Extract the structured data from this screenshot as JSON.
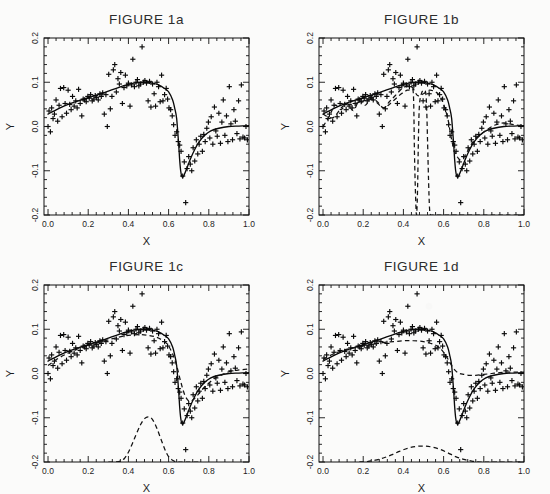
{
  "figure": {
    "background_color": "#fbfbfa",
    "ink_color": "#0a0a0a",
    "panel_count": 4
  },
  "panels": [
    {
      "id": "1a",
      "title": "FIGURE 1a",
      "xlabel": "X",
      "ylabel": "Y"
    },
    {
      "id": "1b",
      "title": "FIGURE 1b",
      "xlabel": "X",
      "ylabel": "Y"
    },
    {
      "id": "1c",
      "title": "FIGURE 1c",
      "xlabel": "X",
      "ylabel": "Y"
    },
    {
      "id": "1d",
      "title": "FIGURE 1d",
      "xlabel": "X",
      "ylabel": "Y"
    }
  ],
  "chart_data": [
    {
      "type": "scatter",
      "panel": "1a",
      "title": "FIGURE 1a",
      "xlabel": "X",
      "ylabel": "Y",
      "xlim": [
        -0.02,
        1.0
      ],
      "ylim": [
        -0.2,
        0.2
      ],
      "xticks": [
        0.0,
        0.2,
        0.4,
        0.6,
        0.8,
        1.0
      ],
      "yticks": [
        -0.2,
        -0.1,
        0.0,
        0.1,
        0.2
      ],
      "xtick_labels": [
        "0.0",
        "0.2",
        "0.4",
        "0.6",
        "0.8",
        "1.0"
      ],
      "ytick_labels": [
        "-0.2",
        "-0.1",
        "0.0",
        "0.1",
        "0.2"
      ],
      "minor_ticks_per_interval": 4,
      "grid": false,
      "legend": false,
      "marker": "plus",
      "series": [
        {
          "name": "data",
          "type": "scatter",
          "marker": "plus",
          "x": [
            0.0,
            0.005,
            0.012,
            0.018,
            0.025,
            0.032,
            0.04,
            0.048,
            0.055,
            0.062,
            0.07,
            0.078,
            0.085,
            0.092,
            0.1,
            0.108,
            0.115,
            0.122,
            0.13,
            0.138,
            0.145,
            0.152,
            0.16,
            0.168,
            0.175,
            0.182,
            0.19,
            0.198,
            0.205,
            0.212,
            0.22,
            0.228,
            0.235,
            0.242,
            0.25,
            0.258,
            0.265,
            0.272,
            0.28,
            0.288,
            0.295,
            0.302,
            0.31,
            0.318,
            0.325,
            0.332,
            0.34,
            0.348,
            0.355,
            0.362,
            0.37,
            0.378,
            0.385,
            0.392,
            0.4,
            0.408,
            0.415,
            0.422,
            0.43,
            0.438,
            0.445,
            0.452,
            0.46,
            0.468,
            0.475,
            0.482,
            0.49,
            0.498,
            0.505,
            0.512,
            0.52,
            0.528,
            0.535,
            0.542,
            0.55,
            0.558,
            0.565,
            0.572,
            0.58,
            0.588,
            0.595,
            0.602,
            0.61,
            0.618,
            0.625,
            0.632,
            0.64,
            0.648,
            0.655,
            0.662,
            0.67,
            0.678,
            0.685,
            0.692,
            0.7,
            0.708,
            0.715,
            0.722,
            0.73,
            0.738,
            0.745,
            0.752,
            0.76,
            0.768,
            0.775,
            0.782,
            0.79,
            0.798,
            0.805,
            0.812,
            0.82,
            0.828,
            0.835,
            0.842,
            0.85,
            0.858,
            0.865,
            0.872,
            0.88,
            0.888,
            0.895,
            0.902,
            0.91,
            0.918,
            0.925,
            0.932,
            0.94,
            0.948,
            0.955,
            0.962,
            0.97,
            0.978,
            0.985,
            0.992
          ],
          "y": [
            0.0,
            0.035,
            -0.012,
            0.042,
            0.018,
            0.028,
            0.06,
            0.012,
            0.048,
            0.086,
            0.022,
            0.088,
            0.052,
            0.03,
            0.082,
            0.05,
            0.038,
            0.068,
            0.046,
            0.058,
            0.042,
            0.084,
            0.052,
            0.024,
            0.062,
            0.06,
            0.056,
            0.068,
            0.064,
            0.072,
            0.058,
            0.062,
            0.07,
            0.066,
            0.06,
            0.074,
            0.068,
            0.076,
            0.028,
            0.072,
            0.0,
            0.118,
            0.04,
            0.068,
            0.128,
            0.14,
            0.078,
            0.108,
            0.096,
            0.122,
            0.052,
            0.088,
            0.116,
            0.092,
            0.098,
            0.046,
            0.094,
            0.152,
            0.09,
            0.1,
            0.106,
            0.092,
            0.096,
            0.18,
            0.1,
            0.104,
            0.098,
            0.058,
            0.102,
            0.044,
            0.096,
            0.074,
            0.046,
            0.1,
            0.09,
            0.056,
            0.116,
            0.058,
            0.072,
            0.086,
            0.062,
            0.042,
            0.038,
            0.024,
            0.004,
            -0.02,
            -0.012,
            -0.034,
            -0.042,
            -0.056,
            -0.112,
            -0.08,
            -0.172,
            -0.095,
            -0.068,
            -0.085,
            -0.1,
            -0.048,
            -0.078,
            -0.03,
            -0.062,
            -0.04,
            -0.022,
            -0.056,
            -0.018,
            -0.034,
            -0.004,
            0.01,
            -0.026,
            0.022,
            -0.04,
            0.044,
            -0.01,
            -0.022,
            0.03,
            -0.038,
            0.01,
            0.06,
            -0.02,
            0.024,
            -0.034,
            0.09,
            0.006,
            -0.03,
            0.038,
            0.012,
            -0.016,
            0.058,
            -0.028,
            0.094,
            -0.024,
            -0.026,
            0.0,
            -0.03
          ]
        },
        {
          "name": "fit-solid",
          "type": "line",
          "style": "solid",
          "x": [
            0.0,
            0.05,
            0.1,
            0.15,
            0.2,
            0.25,
            0.3,
            0.35,
            0.4,
            0.43,
            0.46,
            0.49,
            0.52,
            0.55,
            0.58,
            0.6,
            0.62,
            0.63,
            0.64,
            0.65,
            0.655,
            0.66,
            0.665,
            0.67,
            0.675,
            0.69,
            0.71,
            0.73,
            0.75,
            0.78,
            0.81,
            0.85,
            0.9,
            0.95,
            1.0
          ],
          "y": [
            0.028,
            0.04,
            0.05,
            0.058,
            0.065,
            0.072,
            0.08,
            0.088,
            0.095,
            0.098,
            0.1,
            0.1,
            0.098,
            0.094,
            0.086,
            0.078,
            0.06,
            0.042,
            0.018,
            -0.04,
            -0.075,
            -0.1,
            -0.112,
            -0.115,
            -0.112,
            -0.095,
            -0.072,
            -0.052,
            -0.036,
            -0.02,
            -0.01,
            -0.004,
            0.0,
            0.001,
            0.002
          ]
        }
      ]
    },
    {
      "type": "scatter",
      "panel": "1b",
      "title": "FIGURE 1b",
      "xlabel": "X",
      "ylabel": "Y",
      "xlim": [
        -0.02,
        1.0
      ],
      "ylim": [
        -0.2,
        0.2
      ],
      "xticks": [
        0.0,
        0.2,
        0.4,
        0.6,
        0.8,
        1.0
      ],
      "yticks": [
        -0.2,
        -0.1,
        0.0,
        0.1,
        0.2
      ],
      "xtick_labels": [
        "0.0",
        "0.2",
        "0.4",
        "0.6",
        "0.8",
        "1.0"
      ],
      "ytick_labels": [
        "-0.2",
        "-0.1",
        "0.0",
        "0.1",
        "0.2"
      ],
      "minor_ticks_per_interval": 4,
      "grid": false,
      "legend": false,
      "marker": "plus",
      "series": [
        {
          "name": "data",
          "type": "scatter",
          "marker": "plus",
          "shared_with": "1a"
        },
        {
          "name": "fit-solid",
          "type": "line",
          "style": "solid",
          "shared_with": "1a"
        },
        {
          "name": "fit-dashed-spike",
          "type": "line",
          "style": "dashed",
          "description": "wiggly estimate with narrow tall spike centred at x=0.50",
          "x": [
            0.0,
            0.03,
            0.06,
            0.09,
            0.12,
            0.15,
            0.18,
            0.21,
            0.24,
            0.27,
            0.3,
            0.33,
            0.36,
            0.39,
            0.42,
            0.44,
            0.45,
            0.455,
            0.46,
            0.465,
            0.47,
            0.475,
            0.48,
            0.49,
            0.5,
            0.51,
            0.515,
            0.52,
            0.525,
            0.53,
            0.535,
            0.54,
            0.55,
            0.57,
            0.59,
            0.6,
            0.61,
            0.62,
            0.63,
            0.64,
            0.65,
            0.66,
            0.67,
            0.68,
            0.69,
            0.7,
            0.72,
            0.74,
            0.76,
            0.78,
            0.8,
            0.83,
            0.86,
            0.9,
            0.94,
            1.0
          ],
          "y": [
            0.0,
            0.022,
            0.048,
            0.038,
            0.052,
            0.036,
            0.058,
            0.048,
            0.064,
            0.056,
            0.042,
            0.05,
            0.062,
            0.074,
            0.082,
            0.08,
            0.07,
            -0.06,
            -0.15,
            -0.2,
            -0.15,
            -0.02,
            0.05,
            0.075,
            0.082,
            0.078,
            0.05,
            -0.03,
            -0.12,
            -0.185,
            -0.2,
            -0.2,
            -0.2,
            -0.2,
            -0.2,
            -0.2,
            -0.2,
            -0.2,
            -0.2,
            -0.2,
            -0.2,
            -0.2,
            -0.2,
            -0.2,
            -0.2,
            -0.2,
            -0.2,
            -0.2,
            -0.2,
            -0.2,
            -0.2,
            -0.2,
            -0.2,
            -0.2,
            -0.2,
            -0.2
          ]
        },
        {
          "name": "fit-dashed-main",
          "type": "line",
          "style": "dashed",
          "description": "dashed regression overlaying the solid fit",
          "x": [
            0.0,
            0.05,
            0.1,
            0.15,
            0.2,
            0.25,
            0.3,
            0.33,
            0.36,
            0.4,
            0.44,
            0.47,
            0.5,
            0.53,
            0.56,
            0.58,
            0.6,
            0.62,
            0.63,
            0.64,
            0.65,
            0.66,
            0.68,
            0.7,
            0.72,
            0.75,
            0.78,
            0.82,
            0.86,
            0.9,
            0.95,
            1.0
          ],
          "y": [
            0.028,
            0.02,
            0.046,
            0.05,
            0.058,
            0.06,
            0.042,
            0.056,
            0.07,
            0.088,
            0.09,
            0.07,
            0.074,
            0.082,
            0.078,
            0.07,
            0.05,
            0.02,
            -0.005,
            -0.03,
            -0.05,
            -0.062,
            -0.075,
            -0.07,
            -0.055,
            -0.032,
            -0.02,
            -0.006,
            0.004,
            0.008,
            0.004,
            0.002
          ]
        }
      ]
    },
    {
      "type": "scatter",
      "panel": "1c",
      "title": "FIGURE 1c",
      "xlabel": "X",
      "ylabel": "Y",
      "xlim": [
        -0.02,
        1.0
      ],
      "ylim": [
        -0.2,
        0.2
      ],
      "xticks": [
        0.0,
        0.2,
        0.4,
        0.6,
        0.8,
        1.0
      ],
      "yticks": [
        -0.2,
        -0.1,
        0.0,
        0.1,
        0.2
      ],
      "xtick_labels": [
        "0.0",
        "0.2",
        "0.4",
        "0.6",
        "0.8",
        "1.0"
      ],
      "ytick_labels": [
        "-0.2",
        "-0.1",
        "0.0",
        "0.1",
        "0.2"
      ],
      "minor_ticks_per_interval": 4,
      "grid": false,
      "legend": false,
      "marker": "plus",
      "series": [
        {
          "name": "data",
          "type": "scatter",
          "marker": "plus",
          "shared_with": "1a"
        },
        {
          "name": "fit-solid",
          "type": "line",
          "style": "solid",
          "shared_with": "1a"
        },
        {
          "name": "fit-dashed-main",
          "type": "line",
          "style": "dashed",
          "description": "smooth dashed estimate, shallower trough than solid",
          "x": [
            0.0,
            0.05,
            0.1,
            0.15,
            0.2,
            0.25,
            0.3,
            0.35,
            0.4,
            0.45,
            0.5,
            0.54,
            0.58,
            0.6,
            0.62,
            0.64,
            0.66,
            0.68,
            0.7,
            0.72,
            0.75,
            0.78,
            0.82,
            0.86,
            0.9,
            0.95,
            1.0
          ],
          "y": [
            0.018,
            0.034,
            0.046,
            0.056,
            0.064,
            0.07,
            0.076,
            0.082,
            0.086,
            0.088,
            0.086,
            0.082,
            0.072,
            0.062,
            0.044,
            0.018,
            -0.018,
            -0.048,
            -0.062,
            -0.06,
            -0.046,
            -0.03,
            -0.014,
            -0.004,
            0.004,
            0.008,
            0.01
          ]
        },
        {
          "name": "bump-dashed",
          "type": "line",
          "style": "dashed",
          "description": "gaussian-like bump on the floor, peak y=-0.098 at x=0.50",
          "x": [
            0.3,
            0.33,
            0.36,
            0.38,
            0.4,
            0.42,
            0.44,
            0.46,
            0.48,
            0.5,
            0.52,
            0.54,
            0.56,
            0.58,
            0.6,
            0.62,
            0.64,
            0.66,
            0.7,
            0.75
          ],
          "y": [
            -0.2,
            -0.2,
            -0.198,
            -0.192,
            -0.178,
            -0.158,
            -0.136,
            -0.116,
            -0.102,
            -0.098,
            -0.104,
            -0.122,
            -0.146,
            -0.17,
            -0.188,
            -0.196,
            -0.2,
            -0.2,
            -0.2,
            -0.2
          ]
        }
      ]
    },
    {
      "type": "scatter",
      "panel": "1d",
      "title": "FIGURE 1d",
      "xlabel": "X",
      "ylabel": "Y",
      "xlim": [
        -0.02,
        1.0
      ],
      "ylim": [
        -0.2,
        0.2
      ],
      "xticks": [
        0.0,
        0.2,
        0.4,
        0.6,
        0.8,
        1.0
      ],
      "yticks": [
        -0.2,
        -0.1,
        0.0,
        0.1,
        0.2
      ],
      "xtick_labels": [
        "0.0",
        "0.2",
        "0.4",
        "0.6",
        "0.8",
        "1.0"
      ],
      "ytick_labels": [
        "-0.2",
        "-0.1",
        "0.0",
        "0.1",
        "0.2"
      ],
      "minor_ticks_per_interval": 4,
      "grid": false,
      "legend": false,
      "marker": "plus",
      "series": [
        {
          "name": "data",
          "type": "scatter",
          "marker": "plus",
          "shared_with": "1a"
        },
        {
          "name": "fit-solid",
          "type": "line",
          "style": "solid",
          "shared_with": "1a"
        },
        {
          "name": "fit-dashed-main",
          "type": "line",
          "style": "dashed",
          "description": "oversmoothed dashed estimate, flat hump, very shallow trough",
          "x": [
            0.0,
            0.05,
            0.1,
            0.15,
            0.2,
            0.25,
            0.3,
            0.35,
            0.4,
            0.45,
            0.5,
            0.55,
            0.58,
            0.6,
            0.62,
            0.64,
            0.66,
            0.68,
            0.7,
            0.73,
            0.76,
            0.8,
            0.84,
            0.88,
            0.92,
            0.96,
            1.0
          ],
          "y": [
            0.032,
            0.044,
            0.052,
            0.058,
            0.062,
            0.066,
            0.07,
            0.072,
            0.074,
            0.074,
            0.072,
            0.066,
            0.058,
            0.048,
            0.034,
            0.018,
            0.006,
            0.0,
            -0.002,
            -0.004,
            -0.004,
            -0.002,
            0.0,
            0.002,
            0.003,
            0.003,
            0.003
          ]
        },
        {
          "name": "bump-dashed",
          "type": "line",
          "style": "dashed",
          "description": "wide shallow bump on the floor, peak y=-0.164 at x=0.50",
          "x": [
            0.18,
            0.22,
            0.26,
            0.3,
            0.34,
            0.38,
            0.42,
            0.46,
            0.5,
            0.54,
            0.58,
            0.62,
            0.66,
            0.7,
            0.74,
            0.78,
            0.82,
            0.9,
            1.0
          ],
          "y": [
            -0.2,
            -0.199,
            -0.196,
            -0.191,
            -0.184,
            -0.176,
            -0.169,
            -0.165,
            -0.164,
            -0.166,
            -0.171,
            -0.179,
            -0.188,
            -0.194,
            -0.198,
            -0.2,
            -0.2,
            -0.2,
            -0.2
          ]
        }
      ]
    }
  ]
}
